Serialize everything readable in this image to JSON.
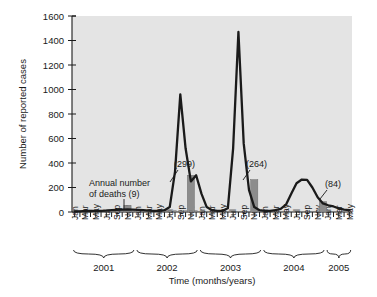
{
  "chart_data": {
    "type": "line",
    "title": "",
    "xlabel": "Time (months/years)",
    "ylabel": "Number of reported cases",
    "ylim": [
      0,
      1600
    ],
    "yticks": [
      0,
      200,
      400,
      600,
      800,
      1000,
      1200,
      1400,
      1600
    ],
    "grid": false,
    "legend": "none",
    "x_tick_labels": [
      "Jan",
      "Mar",
      "May",
      "Jul",
      "Sep",
      "Nov",
      "Jan",
      "Mar",
      "May",
      "Jul",
      "Sep",
      "Nov",
      "Jan",
      "Mar",
      "May",
      "Jul",
      "Sep",
      "Nov",
      "Jan",
      "Mar",
      "May",
      "Jul",
      "Sep",
      "Nov",
      "Jan",
      "Mar",
      "May"
    ],
    "year_groups": [
      {
        "label": "2001",
        "months": 12
      },
      {
        "label": "2002",
        "months": 12
      },
      {
        "label": "2003",
        "months": 12
      },
      {
        "label": "2004",
        "months": 12
      },
      {
        "label": "2005",
        "months": 5
      }
    ],
    "x": [
      "2001-01",
      "2001-02",
      "2001-03",
      "2001-04",
      "2001-05",
      "2001-06",
      "2001-07",
      "2001-08",
      "2001-09",
      "2001-10",
      "2001-11",
      "2001-12",
      "2002-01",
      "2002-02",
      "2002-03",
      "2002-04",
      "2002-05",
      "2002-06",
      "2002-07",
      "2002-08",
      "2002-09",
      "2002-10",
      "2002-11",
      "2002-12",
      "2003-01",
      "2003-02",
      "2003-03",
      "2003-04",
      "2003-05",
      "2003-06",
      "2003-07",
      "2003-08",
      "2003-09",
      "2003-10",
      "2003-11",
      "2003-12",
      "2004-01",
      "2004-02",
      "2004-03",
      "2004-04",
      "2004-05",
      "2004-06",
      "2004-07",
      "2004-08",
      "2004-09",
      "2004-10",
      "2004-11",
      "2004-12",
      "2005-01",
      "2005-02",
      "2005-03",
      "2005-04",
      "2005-05"
    ],
    "series": [
      {
        "name": "Reported cases",
        "values": [
          5,
          5,
          8,
          8,
          10,
          10,
          12,
          15,
          18,
          20,
          22,
          20,
          18,
          15,
          12,
          10,
          10,
          15,
          40,
          330,
          960,
          520,
          250,
          300,
          150,
          40,
          15,
          10,
          10,
          30,
          520,
          1470,
          560,
          180,
          40,
          15,
          10,
          10,
          15,
          25,
          60,
          150,
          235,
          265,
          262,
          200,
          120,
          70,
          55,
          45,
          30,
          20,
          15
        ]
      }
    ],
    "deaths_bars": [
      {
        "year": "2001",
        "label": "",
        "value": 9,
        "bar_height_cases": 55,
        "x_month": "2001-11"
      },
      {
        "year": "2002",
        "label": "(299)",
        "value": 299,
        "bar_height_cases": 300,
        "x_month": "2002-11"
      },
      {
        "year": "2003",
        "label": "(264)",
        "value": 264,
        "bar_height_cases": 264,
        "x_month": "2003-11"
      },
      {
        "year": "2004",
        "label": "(84)",
        "value": 84,
        "bar_height_cases": 84,
        "x_month": "2004-12"
      }
    ],
    "annotations": [
      {
        "name": "annual-deaths-note",
        "line1": "Annual number",
        "line2": "of deaths (9)"
      }
    ],
    "colors": {
      "plot_background": "#e4e4e4",
      "line": "#1a1a1a",
      "bar": "#8c8c8c",
      "text": "#1a1a1a"
    }
  }
}
